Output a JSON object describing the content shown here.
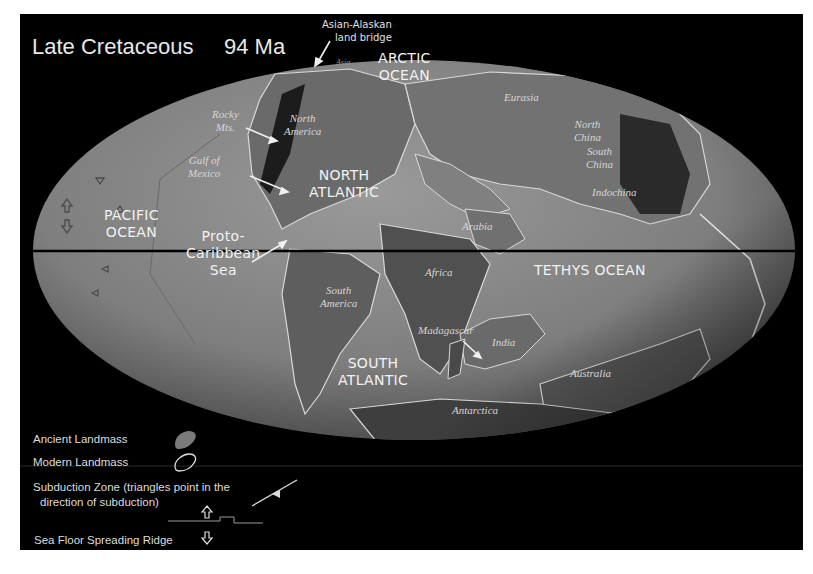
{
  "title": "Late Cretaceous",
  "age": "94 Ma",
  "colors": {
    "background": "#000000",
    "page": "#ffffff",
    "ocean": "#8a8a8a",
    "ancient_land": "#6e6e6e",
    "coastline": "#d8d8d8",
    "label": "#f2f2f2"
  },
  "annotations": {
    "land_bridge": {
      "line1": "Asian-Alaskan",
      "line2": "land bridge"
    },
    "asia_small": "Asia"
  },
  "oceans": {
    "arctic": {
      "line1": "ARCTIC",
      "line2": "OCEAN"
    },
    "pacific": {
      "line1": "PACIFIC",
      "line2": "OCEAN"
    },
    "north_atlantic": {
      "line1": "NORTH",
      "line2": "ATLANTIC"
    },
    "proto_caribbean": {
      "line1": "Proto-",
      "line2": "Caribbean",
      "line3": "Sea"
    },
    "tethys": "TETHYS OCEAN",
    "south_atlantic": {
      "line1": "SOUTH",
      "line2": "ATLANTIC"
    }
  },
  "landmasses": {
    "rocky": {
      "line1": "Rocky",
      "line2": "Mts."
    },
    "north_america": {
      "line1": "North",
      "line2": "America"
    },
    "gulf": {
      "line1": "Gulf of",
      "line2": "Mexico"
    },
    "eurasia": "Eurasia",
    "north_china": {
      "line1": "North",
      "line2": "China"
    },
    "south_china": {
      "line1": "South",
      "line2": "China"
    },
    "indochina": "Indochina",
    "arabia": "Arabia",
    "africa": "Africa",
    "south_america": {
      "line1": "South",
      "line2": "America"
    },
    "madagascar": "Madagascar",
    "india": "India",
    "australia": "Australia",
    "antarctica": "Antarctica"
  },
  "legend": {
    "ancient": "Ancient Landmass",
    "modern": "Modern Landmass",
    "subduction_line1": "Subduction Zone (triangles point in the",
    "subduction_line2": "direction of subduction)",
    "ridge": "Sea Floor Spreading Ridge"
  }
}
